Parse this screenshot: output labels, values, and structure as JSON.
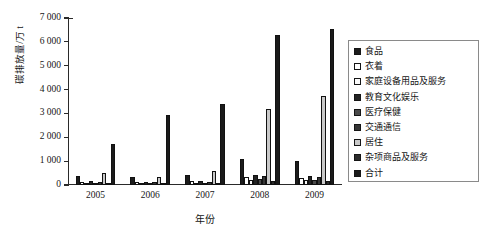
{
  "chart_data": {
    "type": "bar",
    "title": "",
    "xlabel": "年份",
    "ylabel": "碳排放量/万 t",
    "categories": [
      "2005",
      "2006",
      "2007",
      "2008",
      "2009"
    ],
    "ylim": [
      0,
      7000
    ],
    "yticks": [
      0,
      1000,
      2000,
      3000,
      4000,
      5000,
      6000,
      7000
    ],
    "ytick_labels": [
      "0",
      "1 000",
      "2 000",
      "3 000",
      "4 000",
      "5 000",
      "6 000",
      "7 000"
    ],
    "grid": false,
    "legend_position": "right",
    "series": [
      {
        "name": "食品",
        "color": "#1c1c1c",
        "values": [
          380,
          330,
          430,
          1090,
          1010
        ]
      },
      {
        "name": "衣着",
        "color": "#ffffff",
        "values": [
          140,
          110,
          150,
          330,
          300
        ]
      },
      {
        "name": "家庭设备用品及服务",
        "color": "#fafafa",
        "values": [
          80,
          70,
          95,
          230,
          215
        ]
      },
      {
        "name": "教育文化娱乐",
        "color": "#232323",
        "values": [
          150,
          130,
          170,
          420,
          390
        ]
      },
      {
        "name": "医疗保健",
        "color": "#4a4a4a",
        "values": [
          90,
          80,
          105,
          250,
          230
        ]
      },
      {
        "name": "交通通信",
        "color": "#353535",
        "values": [
          120,
          110,
          145,
          370,
          345
        ]
      },
      {
        "name": "居住",
        "color": "#c9c9c9",
        "values": [
          500,
          350,
          600,
          3200,
          3750
        ]
      },
      {
        "name": "杂项商品及服务",
        "color": "#2b2b2b",
        "values": [
          60,
          55,
          70,
          180,
          165
        ]
      },
      {
        "name": "合计",
        "color": "#1a1a1a",
        "values": [
          1700,
          2950,
          3400,
          6300,
          6550
        ]
      }
    ]
  },
  "axes": {
    "y_title": "碳排放量/万 t",
    "x_title": "年份"
  },
  "legend": {
    "items": [
      {
        "label": "食品"
      },
      {
        "label": "衣着"
      },
      {
        "label": "家庭设备用品及服务"
      },
      {
        "label": "教育文化娱乐"
      },
      {
        "label": "医疗保健"
      },
      {
        "label": "交通通信"
      },
      {
        "label": "居住"
      },
      {
        "label": "杂项商品及服务"
      },
      {
        "label": "合计"
      }
    ]
  }
}
